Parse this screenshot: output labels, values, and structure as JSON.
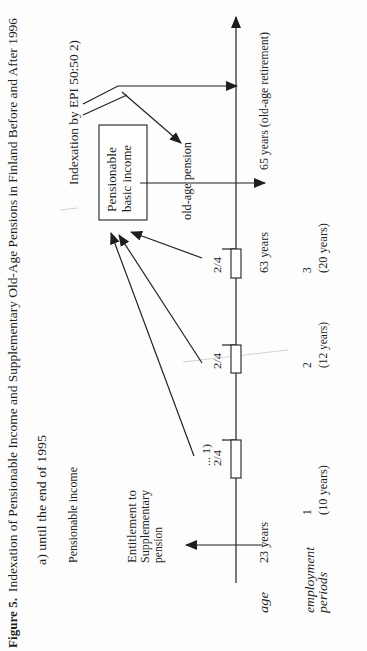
{
  "figure": {
    "title_bold": "Figure 5.",
    "title_rest": "Indexation of Pensionable Income and Supplementary Old-Age Pensions in Finland Before and After 1996",
    "subtitle": "a) until the end of 1995"
  },
  "labels": {
    "indexation": "Indexation by EPI 50:50 2)",
    "pensionable_income": "Pensionable income",
    "box_line1": "Pensionable",
    "box_line2": "basic income",
    "old_age_pension": "old-age pension",
    "entitlement": [
      "Entitlement to",
      "Supplementary",
      "pension"
    ],
    "footnote_marker": "... 1)"
  },
  "axis": {
    "age_label": "age",
    "employment_label": [
      "employment",
      "periods"
    ],
    "age_start": "23 years",
    "age_end_period": "63 years",
    "age_retirement": "65 years (old-age retirement)"
  },
  "periods": [
    {
      "number": "1",
      "duration": "(10 years)",
      "accrual": "2/4"
    },
    {
      "number": "2",
      "duration": "(12 years)",
      "accrual": "2/4"
    },
    {
      "number": "3",
      "duration": "(20 years)",
      "accrual": "2/4"
    }
  ],
  "colors": {
    "ink": "#222222",
    "background": "#fdfdfd"
  }
}
